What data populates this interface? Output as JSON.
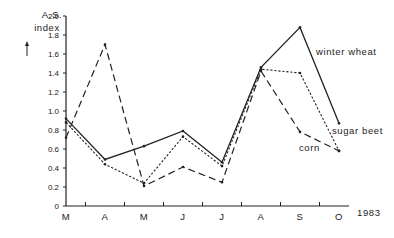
{
  "chart_data": {
    "type": "line",
    "title": "",
    "ylabel": "A.S. index",
    "xlabel": "1983",
    "ylim": [
      0,
      2.0
    ],
    "yticks": [
      0,
      0.2,
      0.4,
      0.6,
      0.8,
      1.0,
      1.2,
      1.4,
      1.6,
      1.8,
      2.0
    ],
    "ytick_labels": [
      "0",
      "0.2",
      "0.4",
      "0.6",
      "0.8",
      "1.0",
      "1.2",
      "1.4",
      "1.6",
      "1.8",
      "2.0"
    ],
    "categories": [
      "M",
      "A",
      "M",
      "J",
      "J",
      "A",
      "S",
      "O"
    ],
    "grid": false,
    "legend": "inline labels at line ends",
    "series": [
      {
        "name": "winter wheat",
        "style": "solid",
        "values": [
          0.92,
          0.49,
          0.63,
          0.79,
          0.46,
          1.46,
          1.88,
          0.87
        ]
      },
      {
        "name": "sugar beet",
        "style": "dotted",
        "values": [
          0.88,
          0.44,
          0.24,
          0.73,
          0.42,
          1.44,
          1.4,
          0.58
        ]
      },
      {
        "name": "corn",
        "style": "dashed",
        "values": [
          0.72,
          1.7,
          0.21,
          0.41,
          0.25,
          1.42,
          0.78,
          0.58
        ]
      }
    ]
  },
  "labels": {
    "ylabel_line1": "A.S.",
    "ylabel_line2": "index",
    "ylabel_arrow": "↑",
    "year": "1983",
    "winter_wheat": "winter wheat",
    "sugar_beet": "sugar beet",
    "corn": "corn"
  }
}
